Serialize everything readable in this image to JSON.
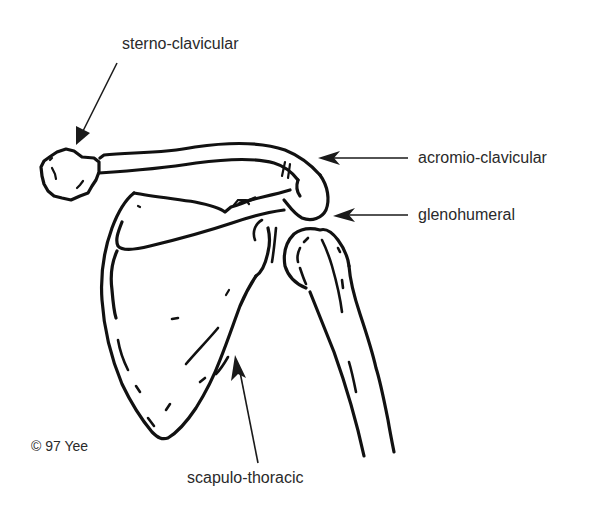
{
  "diagram": {
    "labels": {
      "sterno_clavicular": "sterno-clavicular",
      "acromio_clavicular": "acromio-clavicular",
      "glenohumeral": "glenohumeral",
      "scapulo_thoracic": "scapulo-thoracic"
    },
    "credit": "© 97 Yee",
    "colors": {
      "line": "#111111",
      "text": "#2a2a2a",
      "background": "#ffffff"
    }
  }
}
